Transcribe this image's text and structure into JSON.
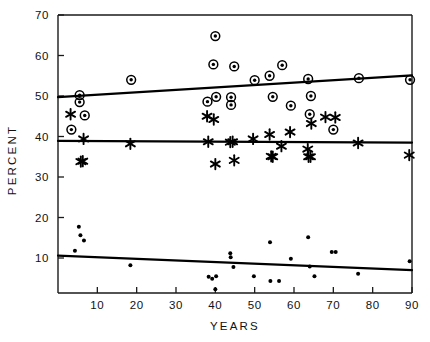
{
  "chart_data": {
    "type": "scatter",
    "title": "",
    "xlabel": "YEARS",
    "ylabel": "PERCENT",
    "xlim": [
      0,
      90
    ],
    "ylim": [
      0,
      70
    ],
    "xticks": [
      10,
      20,
      30,
      40,
      50,
      60,
      70,
      80,
      90
    ],
    "yticks": [
      10,
      20,
      30,
      40,
      50,
      60,
      70
    ],
    "grid": false,
    "legend": "none",
    "series": [
      {
        "name": "circled-dot-series",
        "marker": "circle-with-center-dot",
        "points": [
          [
            5.5,
            50.2
          ],
          [
            5.5,
            48.5
          ],
          [
            6.8,
            45.2
          ],
          [
            3.4,
            41.7
          ],
          [
            18.6,
            54.0
          ],
          [
            38.0,
            48.6
          ],
          [
            39.5,
            57.8
          ],
          [
            40.0,
            64.8
          ],
          [
            40.2,
            49.8
          ],
          [
            44.0,
            49.7
          ],
          [
            44.0,
            47.8
          ],
          [
            44.8,
            57.3
          ],
          [
            50.0,
            53.9
          ],
          [
            53.8,
            55.0
          ],
          [
            54.6,
            49.8
          ],
          [
            57.0,
            57.6
          ],
          [
            59.2,
            47.6
          ],
          [
            63.6,
            54.2
          ],
          [
            64.0,
            45.5
          ],
          [
            64.3,
            50.0
          ],
          [
            70.0,
            41.7
          ],
          [
            76.5,
            54.4
          ],
          [
            89.5,
            54.0
          ]
        ],
        "trendline": {
          "x0": 0,
          "y0": 49.7,
          "x1": 90,
          "y1": 55.1
        }
      },
      {
        "name": "asterisk-series",
        "marker": "asterisk",
        "points": [
          [
            3.2,
            45.5
          ],
          [
            6.5,
            39.4
          ],
          [
            5.8,
            33.8
          ],
          [
            6.3,
            33.9
          ],
          [
            18.4,
            38.2
          ],
          [
            37.9,
            45.0
          ],
          [
            38.2,
            38.7
          ],
          [
            39.6,
            44.2
          ],
          [
            40.0,
            33.2
          ],
          [
            43.8,
            38.6
          ],
          [
            44.4,
            38.7
          ],
          [
            44.8,
            34.1
          ],
          [
            49.6,
            39.4
          ],
          [
            53.8,
            40.5
          ],
          [
            54.2,
            35.1
          ],
          [
            54.6,
            35.0
          ],
          [
            56.8,
            37.6
          ],
          [
            59.0,
            41.1
          ],
          [
            63.5,
            36.9
          ],
          [
            63.7,
            35.0
          ],
          [
            64.2,
            35.0
          ],
          [
            64.4,
            43.2
          ],
          [
            68.0,
            44.8
          ],
          [
            70.5,
            44.7
          ],
          [
            76.3,
            38.4
          ],
          [
            89.3,
            35.4
          ]
        ],
        "trendline": {
          "x0": 0,
          "y0": 38.9,
          "x1": 90,
          "y1": 38.5
        }
      },
      {
        "name": "small-dot-series",
        "marker": "small-dot",
        "points": [
          [
            4.3,
            11.8
          ],
          [
            5.3,
            17.7
          ],
          [
            5.7,
            15.6
          ],
          [
            6.6,
            14.3
          ],
          [
            18.4,
            8.2
          ],
          [
            38.3,
            5.4
          ],
          [
            39.2,
            4.9
          ],
          [
            40.2,
            5.5
          ],
          [
            40.0,
            2.3
          ],
          [
            43.8,
            11.2
          ],
          [
            43.9,
            10.2
          ],
          [
            44.6,
            7.8
          ],
          [
            49.8,
            5.5
          ],
          [
            53.9,
            13.9
          ],
          [
            54.0,
            4.3
          ],
          [
            56.2,
            4.3
          ],
          [
            59.2,
            9.8
          ],
          [
            63.6,
            15.1
          ],
          [
            64.0,
            7.9
          ],
          [
            65.2,
            5.5
          ],
          [
            69.6,
            11.5
          ],
          [
            70.6,
            11.5
          ],
          [
            76.3,
            6.1
          ],
          [
            89.4,
            9.2
          ]
        ],
        "trendline": {
          "x0": 0,
          "y0": 10.6,
          "x1": 90,
          "y1": 7.0
        }
      }
    ]
  },
  "axes": {
    "x_title": "YEARS",
    "y_title": "PERCENT",
    "x_tick_labels": [
      "10",
      "20",
      "30",
      "40",
      "50",
      "60",
      "70",
      "80",
      "90"
    ],
    "y_tick_labels": [
      "70",
      "60",
      "50",
      "40",
      "30",
      "20",
      "10"
    ]
  },
  "colors": {
    "ink": "#000000",
    "background": "#ffffff"
  }
}
